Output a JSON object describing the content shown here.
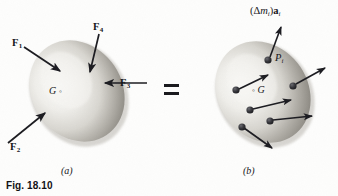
{
  "figure": {
    "number_label": "Fig. 18.10",
    "equals_symbol": "=",
    "panels": [
      {
        "id": "a",
        "caption": "(a)"
      },
      {
        "id": "b",
        "caption": "(b)"
      }
    ]
  },
  "panel_a": {
    "body_center_label": "G",
    "body_center_marker": "◦",
    "forces": [
      {
        "name": "F1",
        "letter": "F",
        "subscript": "1"
      },
      {
        "name": "F2",
        "letter": "F",
        "subscript": "2"
      },
      {
        "name": "F3",
        "letter": "F",
        "subscript": "3"
      },
      {
        "name": "F4",
        "letter": "F",
        "subscript": "4"
      }
    ]
  },
  "panel_b": {
    "body_center_label": "G",
    "body_center_marker": "◦",
    "particle_label": "P",
    "particle_subscript": "i",
    "accel_vector": {
      "open_paren": "(",
      "delta": "Δ",
      "mass": "m",
      "mass_subscript": "i",
      "close_paren": ")",
      "accel": "a",
      "accel_subscript": "i",
      "full": "(Δmᵢ)aᵢ"
    },
    "particle_count": 6
  },
  "colors": {
    "ink": "#16161a",
    "arrow": "#1b1b20",
    "background": "#fdfdfc",
    "body_light": "#f2f1ee",
    "body_shadow": "#8d8b86",
    "particle_fill": "#2a2a2e"
  }
}
